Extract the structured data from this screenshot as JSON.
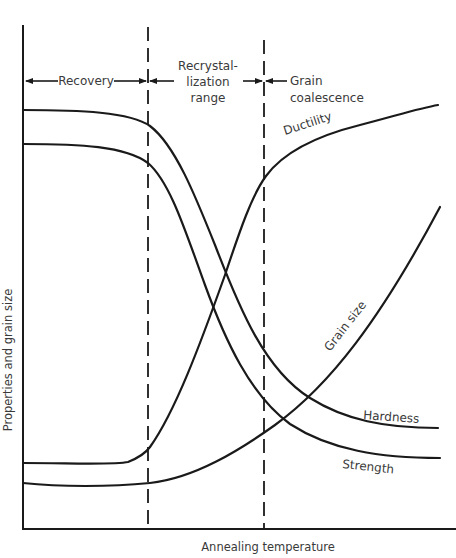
{
  "diagram": {
    "title": "",
    "x_axis_label": "Annealing temperature",
    "y_axis_label": "Properties and grain size",
    "regions": [
      {
        "id": "recovery",
        "label": "Recovery"
      },
      {
        "id": "recrystallization",
        "label_lines": [
          "Recrystal-",
          "lization",
          "range"
        ]
      },
      {
        "id": "grain-coalescence",
        "label_lines": [
          "Grain",
          "coalescence"
        ]
      }
    ],
    "curves": [
      {
        "id": "hardness",
        "label": "Hardness",
        "trend": "high plateau, then steep drop in recrystallization range, low plateau"
      },
      {
        "id": "strength",
        "label": "Strength",
        "trend": "high plateau (below hardness), then steep drop, lowest plateau"
      },
      {
        "id": "ductility",
        "label": "Ductility",
        "trend": "low plateau, steep rise in recrystallization range, high plateau"
      },
      {
        "id": "grain-size",
        "label": "Grain size",
        "trend": "flat through recovery, gradual rise, accelerating in grain coalescence"
      }
    ],
    "stroke_color": "#1a1a1a",
    "text_color": "#3a3a3a",
    "background": "#ffffff"
  }
}
